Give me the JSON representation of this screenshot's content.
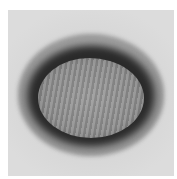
{
  "image": {
    "description": "Grayscale electron micrograph of an oval virus particle with a dark outer ring and a textured lighter core",
    "colors": {
      "background": "#ffffff",
      "frame": "#d8d8d8",
      "ring": "#2a2a2a",
      "core": "#929292"
    }
  }
}
